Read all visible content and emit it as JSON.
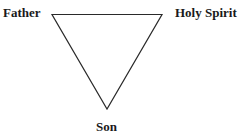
{
  "diagram": {
    "type": "inverted-triangle",
    "stroke_color": "#2a2a2a",
    "vertices": {
      "top_left": {
        "label": "Father"
      },
      "top_right": {
        "label": "Holy Spirit"
      },
      "bottom": {
        "label": "Son"
      }
    }
  }
}
